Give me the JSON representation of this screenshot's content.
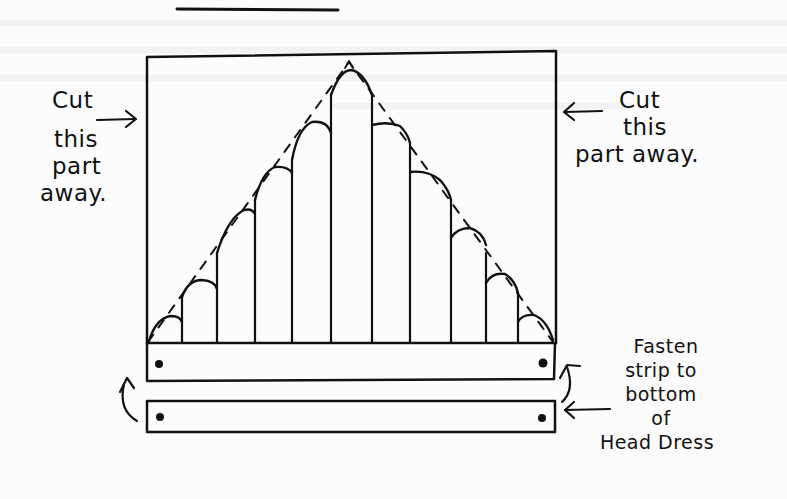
{
  "diagram": {
    "title_rule": "horizontal rule at top of page",
    "headdress": {
      "outline": "rectangle",
      "guide": "dashed triangle from bottom corners to apex",
      "columns": [
        {
          "index": 1,
          "x0": 146,
          "x1": 182,
          "top": 315
        },
        {
          "index": 2,
          "x0": 182,
          "x1": 217,
          "top": 280
        },
        {
          "index": 3,
          "x0": 217,
          "x1": 255,
          "top": 210
        },
        {
          "index": 4,
          "x0": 255,
          "x1": 292,
          "top": 167
        },
        {
          "index": 5,
          "x0": 292,
          "x1": 331,
          "top": 123
        },
        {
          "index": 6,
          "x0": 331,
          "x1": 372,
          "top": 70
        },
        {
          "index": 7,
          "x0": 372,
          "x1": 410,
          "top": 125
        },
        {
          "index": 8,
          "x0": 410,
          "x1": 451,
          "top": 172
        },
        {
          "index": 9,
          "x0": 451,
          "x1": 486,
          "top": 228
        },
        {
          "index": 10,
          "x0": 486,
          "x1": 518,
          "top": 273
        },
        {
          "index": 11,
          "x0": 518,
          "x1": 555,
          "top": 315
        }
      ]
    },
    "strips": [
      {
        "name": "attached-strip",
        "holes": 2
      },
      {
        "name": "loose-strip",
        "holes": 2
      }
    ]
  },
  "labels": {
    "left": {
      "lines": [
        "Cut",
        "this",
        "part",
        "away."
      ]
    },
    "right": {
      "lines": [
        "Cut",
        "this",
        "part away."
      ]
    },
    "fasten": {
      "lines": [
        "Fasten",
        "strip to",
        "bottom",
        "of",
        "Head Dress"
      ]
    }
  },
  "colors": {
    "ink": "#111111",
    "paper": "#fcfcfc"
  }
}
